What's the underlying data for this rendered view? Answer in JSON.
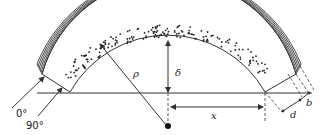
{
  "diagram": {
    "type": "curved laminated section with fiber/particle core",
    "colors": {
      "line": "#333333",
      "dot": "#222222",
      "background": "#ffffff"
    },
    "labels": {
      "angle_0": "0°",
      "angle_90": "90°",
      "radius": "ρ",
      "depth": "δ",
      "distance": "x",
      "thickness_d": "d",
      "thickness_b": "b"
    },
    "elements": [
      {
        "name": "outer-laminate",
        "description": "stack of thin concentric plies on outer edge"
      },
      {
        "name": "core-region",
        "description": "inner band filled with dots"
      },
      {
        "name": "baseline",
        "description": "horizontal reference line"
      },
      {
        "name": "center-point",
        "description": "center of curvature"
      },
      {
        "name": "radius-arrow",
        "label": "ρ"
      },
      {
        "name": "depth-arrow",
        "label": "δ"
      },
      {
        "name": "x-dimension",
        "label": "x"
      },
      {
        "name": "d-dimension",
        "label": "d"
      },
      {
        "name": "b-dimension",
        "label": "b"
      },
      {
        "name": "ply-orientation-0",
        "label": "0°"
      },
      {
        "name": "ply-orientation-90",
        "label": "90°"
      }
    ]
  }
}
